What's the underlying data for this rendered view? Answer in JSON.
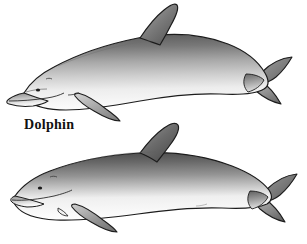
{
  "figure": {
    "kind": "scientific-illustration",
    "background_color": "#ffffff",
    "width": 307,
    "height": 244,
    "subject": "Dolphin",
    "labels": [
      {
        "text": "Dolphin",
        "x": 24,
        "y": 118,
        "style": "bold-serif"
      }
    ],
    "specimens": [
      {
        "name": "dolphin",
        "label": "Dolphin",
        "orientation": "facing-left",
        "head_shape": "beaked-rostrum",
        "dorsal_fin": "falcate-tall",
        "body_top_color": "#5a5a5a",
        "body_mid_color": "#b9b9b9",
        "body_belly_color": "#fdfdfd",
        "outline_color": "#1c1c1c"
      },
      {
        "name": "porpoise",
        "label": "",
        "orientation": "facing-left",
        "head_shape": "blunt-rounded",
        "dorsal_fin": "falcate-broad",
        "body_top_color": "#4e4e4e",
        "body_mid_color": "#9e9e9e",
        "body_belly_color": "#ffffff",
        "outline_color": "#1c1c1c"
      }
    ],
    "palette": {
      "ink": "#1c1c1c",
      "shadow": "#4e4e4e",
      "midtone": "#a8a8a8",
      "highlight": "#fdfdfd",
      "paper": "#ffffff"
    }
  }
}
